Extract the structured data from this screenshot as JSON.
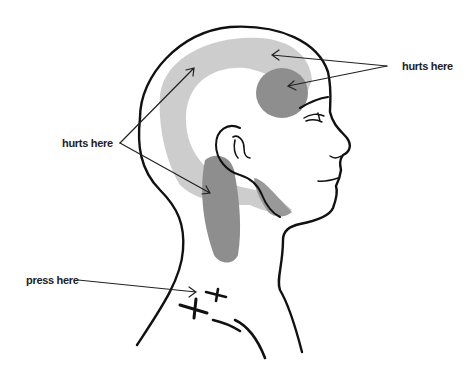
{
  "diagram": {
    "labels": {
      "forehead": "hurts here",
      "side_of_head": "hurts here",
      "trigger_point": "press here"
    },
    "colors": {
      "outline": "#111111",
      "pain_light": "#c8c8c8",
      "pain_dark": "#8e8e8e",
      "arrow": "#222222",
      "background": "#ffffff"
    },
    "trigger_point_marks": 2
  }
}
